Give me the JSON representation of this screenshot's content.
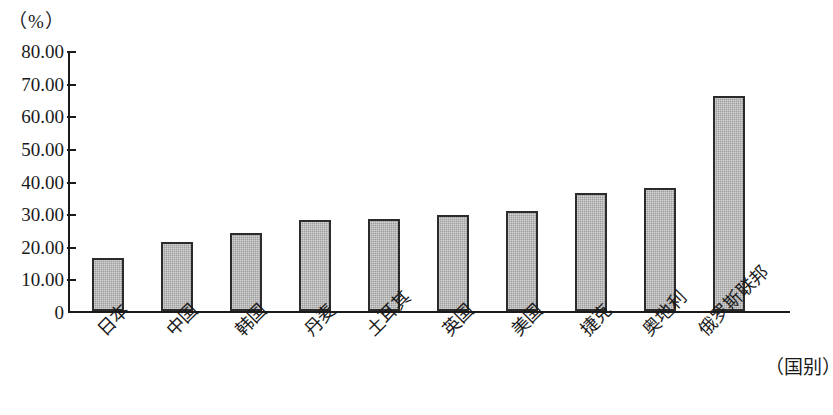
{
  "chart_data": {
    "type": "bar",
    "title": "",
    "subtitle": "",
    "unit_caption": "（%）",
    "xlabel": "（国别）",
    "ylabel": "",
    "ylim": [
      0,
      80
    ],
    "ytick_step": 10,
    "grid": false,
    "legend": null,
    "categories": [
      "日本",
      "中国",
      "韩国",
      "丹麦",
      "土耳其",
      "英国",
      "美国",
      "捷克",
      "奥地利",
      "俄罗斯联邦"
    ],
    "values": [
      16.3,
      21.2,
      23.9,
      27.9,
      28.2,
      29.4,
      30.8,
      36.2,
      37.8,
      65.8
    ],
    "ytick_labels": [
      "80.00",
      "70.00",
      "60.00",
      "50.00",
      "40.00",
      "30.00",
      "20.00",
      "10.00",
      "0"
    ],
    "ytick_values": [
      80,
      70,
      60,
      50,
      40,
      30,
      20,
      10,
      0
    ],
    "colors": {
      "bar_fill": "#9e9e9e",
      "bar_border": "#2b2b2b",
      "axis": "#1a1a1a",
      "background": "#ffffff",
      "text": "#1a1a1a"
    }
  }
}
